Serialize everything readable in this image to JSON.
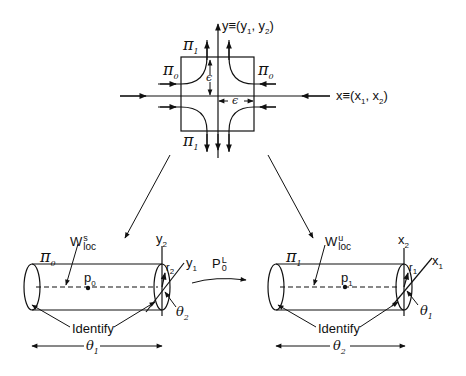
{
  "top_diagram": {
    "y_axis_label": "y≡(y",
    "y_axis_label_sub1": "1",
    "y_axis_label_mid": ", y",
    "y_axis_label_sub2": "2",
    "y_axis_label_end": ")",
    "x_axis_label": "x≡(x",
    "x_axis_label_sub1": "1",
    "x_axis_label_mid": ", x",
    "x_axis_label_sub2": "2",
    "x_axis_label_end": ")",
    "pi1_top": "π",
    "pi1_top_sub": "1",
    "pi1_bottom": "π",
    "pi1_bottom_sub": "1",
    "pi0_left": "π",
    "pi0_left_sub": "0",
    "pi0_right": "π",
    "pi0_right_sub": "0",
    "epsilon_vertical": "ϵ",
    "epsilon_horizontal": "ϵ"
  },
  "left_cylinder": {
    "region": "π",
    "region_sub": "0",
    "manifold": "W",
    "manifold_sup": "s",
    "manifold_sub": "loc",
    "point": "p",
    "point_sub": "0",
    "axis_vertical": "y",
    "axis_vertical_sub": "2",
    "axis_diagonal": "y",
    "axis_diagonal_sub": "1",
    "radius": "r",
    "radius_sub": "2",
    "angle": "θ",
    "angle_sub": "2",
    "identify_label": "Identify",
    "length_label": "θ",
    "length_sub": "1"
  },
  "map": {
    "label": "P",
    "label_sub": "0",
    "label_sup": "L"
  },
  "right_cylinder": {
    "region": "π",
    "region_sub": "1",
    "manifold": "W",
    "manifold_sup": "u",
    "manifold_sub": "loc",
    "point": "p",
    "point_sub": "1",
    "axis_vertical": "x",
    "axis_vertical_sub": "2",
    "axis_diagonal": "x",
    "axis_diagonal_sub": "1",
    "radius": "r",
    "radius_sub": "1",
    "angle": "θ",
    "angle_sub": "1",
    "identify_label": "Identify",
    "length_label": "θ",
    "length_sub": "2"
  }
}
